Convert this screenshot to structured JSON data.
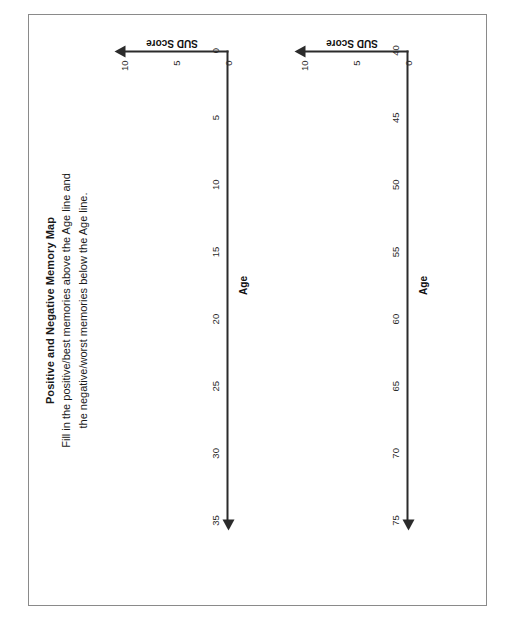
{
  "document": {
    "title": "Positive and Negative Memory Map",
    "instructions_line1": "Fill in the positive/best memories above the Age line and",
    "instructions_line2": "the negative/worst memories below the Age line."
  },
  "colors": {
    "ink": "#1a1a1a",
    "axis": "#2b2b2b",
    "frame": "#8a8a8a",
    "paper": "#ffffff"
  },
  "chart_data": [
    {
      "type": "line",
      "title": "",
      "xlabel": "Age",
      "ylabel": "SUD Score",
      "x_ticks": [
        "0",
        "5",
        "10",
        "15",
        "20",
        "25",
        "30",
        "35"
      ],
      "x_values": [
        0,
        5,
        10,
        15,
        20,
        25,
        30,
        35
      ],
      "y_ticks": [
        "0",
        "5",
        "10"
      ],
      "y_values": [
        0,
        5,
        10
      ],
      "xlim": [
        0,
        35
      ],
      "ylim": [
        0,
        10
      ],
      "grid": false,
      "legend": "none",
      "series": [
        {
          "name": "memory-plot",
          "values": []
        }
      ],
      "annotations": []
    },
    {
      "type": "line",
      "title": "",
      "xlabel": "Age",
      "ylabel": "SUD Score",
      "x_ticks": [
        "40",
        "45",
        "50",
        "55",
        "60",
        "65",
        "70",
        "75"
      ],
      "x_values": [
        40,
        45,
        50,
        55,
        60,
        65,
        70,
        75
      ],
      "y_ticks": [
        "0",
        "5",
        "10"
      ],
      "y_values": [
        0,
        5,
        10
      ],
      "xlim": [
        40,
        75
      ],
      "ylim": [
        0,
        10
      ],
      "grid": false,
      "legend": "none",
      "series": [
        {
          "name": "memory-plot",
          "values": []
        }
      ],
      "annotations": []
    }
  ]
}
